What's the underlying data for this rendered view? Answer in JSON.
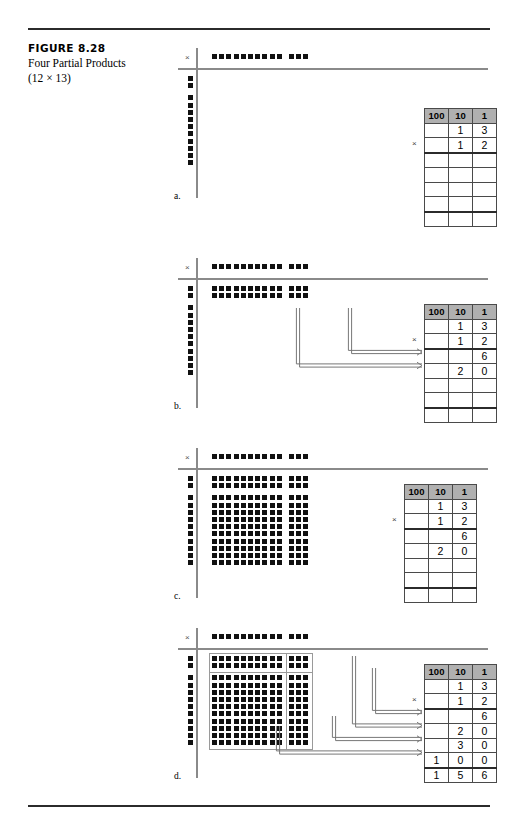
{
  "figure": {
    "number": "FIGURE 8.28",
    "title": "Four Partial Products",
    "subtitle": "(12 × 13)"
  },
  "multiply_symbol": "×",
  "panels": [
    {
      "letter": "a.",
      "top_row_dots": {
        "groups": [
          10,
          3
        ],
        "total": 13
      },
      "left_col_dots": {
        "groups": [
          2,
          10
        ],
        "total": 12
      },
      "grid": null,
      "quadrant_boxes": false,
      "arrows": 0,
      "table": {
        "headers": [
          "100",
          "10",
          "1"
        ],
        "rows": [
          {
            "cells": [
              "",
              "1",
              "3"
            ],
            "rule": false
          },
          {
            "cells": [
              "",
              "1",
              "2"
            ],
            "rule": false
          },
          {
            "cells": [
              "",
              "",
              ""
            ],
            "rule": true
          },
          {
            "cells": [
              "",
              "",
              ""
            ],
            "rule": false
          },
          {
            "cells": [
              "",
              "",
              ""
            ],
            "rule": false
          },
          {
            "cells": [
              "",
              "",
              ""
            ],
            "rule": false
          },
          {
            "cells": [
              "",
              "",
              ""
            ],
            "rule": true
          }
        ]
      }
    },
    {
      "letter": "b.",
      "top_row_dots": {
        "groups": [
          10,
          3
        ],
        "total": 13
      },
      "left_col_dots": {
        "groups": [
          2,
          10
        ],
        "total": 12
      },
      "grid": {
        "rows": 2,
        "cols": 13,
        "row_gap_after": 2,
        "col_gap_after": 10
      },
      "quadrant_boxes": false,
      "arrows": 2,
      "table": {
        "headers": [
          "100",
          "10",
          "1"
        ],
        "rows": [
          {
            "cells": [
              "",
              "1",
              "3"
            ],
            "rule": false
          },
          {
            "cells": [
              "",
              "1",
              "2"
            ],
            "rule": false
          },
          {
            "cells": [
              "",
              "",
              "6"
            ],
            "rule": true
          },
          {
            "cells": [
              "",
              "2",
              "0"
            ],
            "rule": false
          },
          {
            "cells": [
              "",
              "",
              ""
            ],
            "rule": false
          },
          {
            "cells": [
              "",
              "",
              ""
            ],
            "rule": false
          },
          {
            "cells": [
              "",
              "",
              ""
            ],
            "rule": true
          }
        ]
      }
    },
    {
      "letter": "c.",
      "top_row_dots": {
        "groups": [
          10,
          3
        ],
        "total": 13
      },
      "left_col_dots": {
        "groups": [
          2,
          10
        ],
        "total": 12
      },
      "grid": {
        "rows": 12,
        "cols": 13,
        "row_gap_after": 2,
        "col_gap_after": 10
      },
      "quadrant_boxes": false,
      "arrows": 0,
      "table": {
        "headers": [
          "100",
          "10",
          "1"
        ],
        "rows": [
          {
            "cells": [
              "",
              "1",
              "3"
            ],
            "rule": false
          },
          {
            "cells": [
              "",
              "1",
              "2"
            ],
            "rule": false
          },
          {
            "cells": [
              "",
              "",
              "6"
            ],
            "rule": true
          },
          {
            "cells": [
              "",
              "2",
              "0"
            ],
            "rule": false
          },
          {
            "cells": [
              "",
              "",
              ""
            ],
            "rule": false
          },
          {
            "cells": [
              "",
              "",
              ""
            ],
            "rule": false
          },
          {
            "cells": [
              "",
              "",
              ""
            ],
            "rule": true
          }
        ]
      }
    },
    {
      "letter": "d.",
      "top_row_dots": {
        "groups": [
          10,
          3
        ],
        "total": 13
      },
      "left_col_dots": {
        "groups": [
          2,
          10
        ],
        "total": 12
      },
      "grid": {
        "rows": 12,
        "cols": 13,
        "row_gap_after": 2,
        "col_gap_after": 10
      },
      "quadrant_boxes": true,
      "quadrants": [
        {
          "name": "top-left",
          "rows": 2,
          "cols": 10,
          "product": 20
        },
        {
          "name": "top-right",
          "rows": 2,
          "cols": 3,
          "product": 6
        },
        {
          "name": "bottom-left",
          "rows": 10,
          "cols": 10,
          "product": 100
        },
        {
          "name": "bottom-right",
          "rows": 10,
          "cols": 3,
          "product": 30
        }
      ],
      "arrows": 4,
      "table": {
        "headers": [
          "100",
          "10",
          "1"
        ],
        "rows": [
          {
            "cells": [
              "",
              "1",
              "3"
            ],
            "rule": false
          },
          {
            "cells": [
              "",
              "1",
              "2"
            ],
            "rule": false
          },
          {
            "cells": [
              "",
              "",
              "6"
            ],
            "rule": true
          },
          {
            "cells": [
              "",
              "2",
              "0"
            ],
            "rule": false
          },
          {
            "cells": [
              "",
              "3",
              "0"
            ],
            "rule": false
          },
          {
            "cells": [
              "1",
              "0",
              "0"
            ],
            "rule": false
          },
          {
            "cells": [
              "1",
              "5",
              "6"
            ],
            "rule": true
          }
        ]
      }
    }
  ]
}
